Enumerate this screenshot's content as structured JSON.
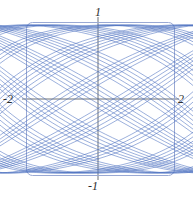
{
  "figure": {
    "title": "",
    "background_color": "#ffffff",
    "width": 193,
    "height": 199
  },
  "frame": {
    "name": "plot-frame",
    "stroke_color": "#9aa9d4",
    "corner_radius": 6,
    "x": 26,
    "y": 22,
    "width": 149,
    "height": 154
  },
  "axes": {
    "stroke_color": "#5b6066",
    "x_axis_label_left": "-2",
    "x_axis_label_right": "2",
    "y_axis_label_top": "1",
    "y_axis_label_bottom": "-1",
    "origin_px": {
      "x": 98,
      "y": 99
    }
  },
  "chart_data": {
    "type": "line",
    "title": "",
    "xlabel": "",
    "ylabel": "",
    "xlim": [
      -2.35,
      2.35
    ],
    "ylim": [
      -1.18,
      1.18
    ],
    "grid": false,
    "legend": false,
    "tick_labels": {
      "x": [
        "-2",
        "2"
      ],
      "y": [
        "-1",
        "1"
      ]
    },
    "curve_color": "#4a6fc0",
    "curve_width": 0.7,
    "parametric": {
      "x_expr": "2 * sin(t) * cos(0.07*t)",
      "y_expr": "1 * cos(1.18*t)",
      "t_range": [
        0,
        188.5
      ],
      "samples": 4200
    },
    "series": [
      {
        "name": "lissajous",
        "color": "#4a6fc0",
        "x_amplitude": 2,
        "y_amplitude": 1,
        "frequency_ratio": 1.18,
        "envelope": "rounded-square"
      }
    ]
  },
  "labels": {
    "top": "1",
    "bottom": "-1",
    "left": "-2",
    "right": "2"
  }
}
